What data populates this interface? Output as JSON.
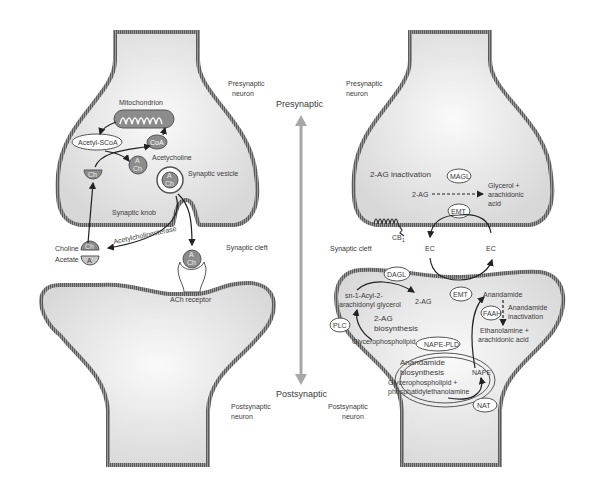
{
  "axis": {
    "top_label": "Presynaptic",
    "bottom_label": "Postsynaptic"
  },
  "colors": {
    "cell_fill": "#dedede",
    "cell_fill_light": "#f6f6f6",
    "membrane": "#8a8a8a",
    "membrane_dark": "#555555",
    "axis_arrow": "#a8a8a8",
    "molecule_fill": "#8c8c8c",
    "text": "#3a3a3a"
  },
  "left_panel": {
    "presynaptic_label_1": "Presynaptic",
    "presynaptic_label_2": "neuron",
    "mitochondrion": "Mitochondrion",
    "acetyl_scoa": "Acetyl-SCoA",
    "coa": "CoA",
    "acetylcholine": "Acetycholine",
    "ach_a": "A",
    "ach_ch": "Ch",
    "ch": "Ch",
    "synaptic_vesicle": "Synaptic vesicle",
    "synaptic_knob": "Synaptic knob",
    "choline": "Choline",
    "acetate": "Acetate",
    "acetate_a": "A",
    "acetylcholinesterase": "Acetylcholinesterase",
    "synaptic_cleft": "Synaptic cleft",
    "ach_receptor": "ACh receptor",
    "postsynaptic_label_1": "Postsynaptic",
    "postsynaptic_label_2": "neuron"
  },
  "right_panel": {
    "presynaptic_label_1": "Presynaptic",
    "presynaptic_label_2": "neuron",
    "inactivation_title": "2-AG inactivation",
    "magl": "MAGL",
    "two_ag": "2-AG",
    "glycerol_1": "Glycerol +",
    "glycerol_2": "arachidonic",
    "glycerol_3": "acid",
    "emt_top": "EMT",
    "cb1": "CB",
    "cb1_sub": "1",
    "synaptic_cleft": "Synaptic cleft",
    "ec_left": "EC",
    "ec_right": "EC",
    "dagl": "DAGL",
    "sn_acyl_1": "sn-1-Acyl-2-",
    "sn_acyl_2": "arachidonyl glycerol",
    "two_ag_post": "2-AG",
    "biosynth_1": "2-AG",
    "biosynth_2": "biosynthesis",
    "plc": "PLC",
    "glycerophospholipid": "Glycerophospholipid",
    "emt_bottom": "EMT",
    "anandamide": "Anandamide",
    "faah": "FAAH",
    "anandamide_inact_1": "Anandamide",
    "anandamide_inact_2": "inactivation",
    "ethanolamine_1": "Ethanolamine +",
    "ethanolamine_2": "arachidonic acid",
    "nape_pld": "NAPE-PLD",
    "anandamide_bio_1": "Anandamide",
    "anandamide_bio_2": "biosynthesis",
    "glyco_pe_1": "Glycerophospholipid +",
    "glyco_pe_2": "phosphatidylethanolamine",
    "nape": "NAPE",
    "nat": "NAT",
    "postsynaptic_label_1": "Postsynaptic",
    "postsynaptic_label_2": "neuron"
  }
}
